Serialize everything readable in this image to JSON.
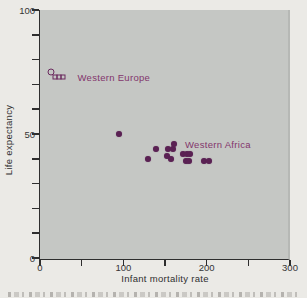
{
  "chart_data": {
    "type": "scatter",
    "xlabel": "Infant mortality rate",
    "ylabel": "Life expectancy",
    "xlim": [
      0,
      300
    ],
    "ylim": [
      0,
      100
    ],
    "x_tick_labels": [
      0,
      100,
      200,
      300
    ],
    "x_minor_tick_step": 50,
    "y_tick_labels": [
      0,
      50,
      100
    ],
    "y_minor_tick_step": 10,
    "grid": false,
    "legend": "inline-labels",
    "series": [
      {
        "name": "Western Europe",
        "marker_style": "open",
        "label_anchor": {
          "x": 45,
          "y": 73
        },
        "points": [
          {
            "x": 13,
            "y": 75,
            "marker": "circle"
          },
          {
            "x": 18,
            "y": 73,
            "marker": "square"
          },
          {
            "x": 23,
            "y": 73,
            "marker": "square"
          },
          {
            "x": 28,
            "y": 73,
            "marker": "square"
          }
        ]
      },
      {
        "name": "Western Africa",
        "marker_style": "filled",
        "label_anchor": {
          "x": 174,
          "y": 46
        },
        "points": [
          {
            "x": 95,
            "y": 50
          },
          {
            "x": 129,
            "y": 40
          },
          {
            "x": 139,
            "y": 44
          },
          {
            "x": 152,
            "y": 41
          },
          {
            "x": 154,
            "y": 44
          },
          {
            "x": 157,
            "y": 40
          },
          {
            "x": 159,
            "y": 44
          },
          {
            "x": 161,
            "y": 46
          },
          {
            "x": 172,
            "y": 42
          },
          {
            "x": 175,
            "y": 39
          },
          {
            "x": 176,
            "y": 42
          },
          {
            "x": 179,
            "y": 39
          },
          {
            "x": 180,
            "y": 42
          },
          {
            "x": 197,
            "y": 39
          },
          {
            "x": 203,
            "y": 39
          }
        ]
      }
    ],
    "colors": {
      "point": "#5a2153",
      "open_marker": "#6b2a5e",
      "series_label": "#83356c",
      "plot_background": "#c5c7c4",
      "page_background": "#ebeae6",
      "axis": "#2e2e2e"
    },
    "caption_note": "partially cropped caption line at bottom edge (illegible)"
  }
}
